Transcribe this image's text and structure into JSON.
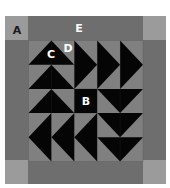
{
  "diagram": {
    "type": "quilt-block",
    "colors": {
      "background": "#ffffff",
      "border": "#6e6e6e",
      "corner": "#9b9b9b",
      "field": "#808080",
      "dark": "#050505",
      "label_light": "#ffffff",
      "label_dark": "#1a1a1a"
    },
    "layout": {
      "outer": {
        "x": 5,
        "y": 16,
        "w": 161,
        "h": 168
      },
      "corner_size": {
        "w": 23,
        "h": 24
      },
      "inner": {
        "x": 28.5,
        "y": 40.5,
        "w": 114.5,
        "h": 121
      },
      "grid": {
        "cols": 5,
        "rows": 5
      }
    },
    "labels": [
      {
        "id": "A",
        "text": "A",
        "x": 17,
        "y": 30,
        "tone": "dark",
        "target": "corner-square"
      },
      {
        "id": "E",
        "text": "E",
        "x": 79,
        "y": 28,
        "tone": "light",
        "target": "border-strip"
      },
      {
        "id": "C",
        "text": "C",
        "x": 51,
        "y": 54,
        "tone": "light",
        "target": "flying-geese-triangle"
      },
      {
        "id": "D",
        "text": "D",
        "x": 68,
        "y": 48,
        "tone": "light",
        "target": "background-triangle"
      },
      {
        "id": "B",
        "text": "B",
        "x": 86,
        "y": 101,
        "tone": "light",
        "target": "center-square"
      }
    ],
    "units": [
      {
        "name": "goose-up-1",
        "direction": "up",
        "col": 0,
        "row": 0,
        "cols": 2,
        "rows": 1
      },
      {
        "name": "goose-up-2",
        "direction": "up",
        "col": 0,
        "row": 1,
        "cols": 2,
        "rows": 1
      },
      {
        "name": "goose-up-3",
        "direction": "up",
        "col": 0,
        "row": 2,
        "cols": 2,
        "rows": 1
      },
      {
        "name": "goose-right-1",
        "direction": "right",
        "col": 2,
        "row": 0,
        "cols": 1,
        "rows": 2
      },
      {
        "name": "goose-right-2",
        "direction": "right",
        "col": 3,
        "row": 0,
        "cols": 1,
        "rows": 2
      },
      {
        "name": "goose-right-3",
        "direction": "right",
        "col": 4,
        "row": 0,
        "cols": 1,
        "rows": 2
      },
      {
        "name": "goose-down-1",
        "direction": "down",
        "col": 3,
        "row": 2,
        "cols": 2,
        "rows": 1
      },
      {
        "name": "goose-down-2",
        "direction": "down",
        "col": 3,
        "row": 3,
        "cols": 2,
        "rows": 1
      },
      {
        "name": "goose-down-3",
        "direction": "down",
        "col": 3,
        "row": 4,
        "cols": 2,
        "rows": 1
      },
      {
        "name": "goose-left-1",
        "direction": "left",
        "col": 0,
        "row": 3,
        "cols": 1,
        "rows": 2
      },
      {
        "name": "goose-left-2",
        "direction": "left",
        "col": 1,
        "row": 3,
        "cols": 1,
        "rows": 2
      },
      {
        "name": "goose-left-3",
        "direction": "left",
        "col": 2,
        "row": 3,
        "cols": 1,
        "rows": 2
      },
      {
        "name": "center-square",
        "direction": "square",
        "col": 2,
        "row": 2,
        "cols": 1,
        "rows": 1
      }
    ]
  }
}
